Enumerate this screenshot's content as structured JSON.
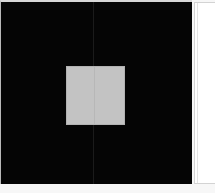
{
  "window": {
    "title": "Canvas View",
    "background_color": "#f7f7f7"
  },
  "canvas": {
    "name": "canvas-viewport",
    "background_color": "#050505",
    "width_px": "192",
    "height_px": "184",
    "panes": [
      {
        "name": "left-pane",
        "width_px": "92"
      },
      {
        "name": "right-pane",
        "width_px": "99"
      }
    ],
    "divider": {
      "name": "pane-divider",
      "x_px": "92",
      "color": "#1b1b1b"
    },
    "object": {
      "name": "selection-rect",
      "shape": "rectangle",
      "fill_color": "#c3c3c3",
      "border_color": "#b2b2b2",
      "x_px": "65",
      "y_px": "64",
      "width_px": "59",
      "height_px": "59"
    }
  },
  "side_panel": {
    "name": "side-panel",
    "background_color": "#ffffff",
    "border_color": "#d3d3d3",
    "x_px": "194",
    "width_px": "21",
    "height_px": "182",
    "content": ""
  }
}
